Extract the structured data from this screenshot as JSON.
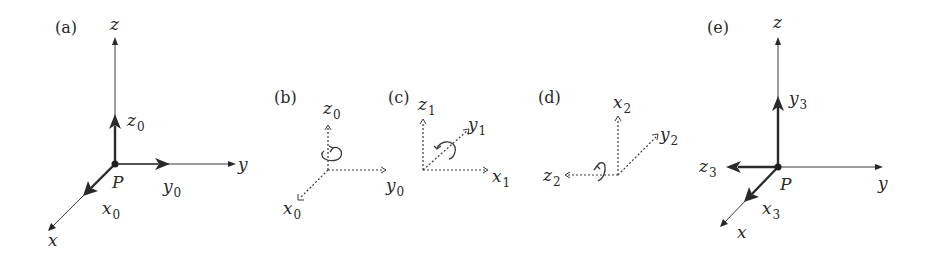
{
  "figure": {
    "panels": [
      {
        "id": "a",
        "label": "(a)",
        "origin_label": "P",
        "axes": {
          "z": "z",
          "y": "y",
          "x": "x"
        },
        "frame": {
          "z": {
            "base": "z",
            "sub": "0"
          },
          "y": {
            "base": "y",
            "sub": "0"
          },
          "x": {
            "base": "x",
            "sub": "0"
          }
        }
      },
      {
        "id": "b",
        "label": "(b)",
        "frame": {
          "z": {
            "base": "z",
            "sub": "0"
          },
          "y": {
            "base": "y",
            "sub": "0"
          },
          "x": {
            "base": "x",
            "sub": "0"
          }
        },
        "rotation_about": "z0"
      },
      {
        "id": "c",
        "label": "(c)",
        "frame": {
          "z": {
            "base": "z",
            "sub": "1"
          },
          "y": {
            "base": "y",
            "sub": "1"
          },
          "x": {
            "base": "x",
            "sub": "1"
          }
        },
        "rotation_about": "y1"
      },
      {
        "id": "d",
        "label": "(d)",
        "frame": {
          "x": {
            "base": "x",
            "sub": "2"
          },
          "y": {
            "base": "y",
            "sub": "2"
          },
          "z": {
            "base": "z",
            "sub": "2"
          }
        },
        "rotation_about": "z2"
      },
      {
        "id": "e",
        "label": "(e)",
        "origin_label": "P",
        "axes": {
          "z": "z",
          "y": "y",
          "x": "x"
        },
        "frame": {
          "y": {
            "base": "y",
            "sub": "3"
          },
          "z": {
            "base": "z",
            "sub": "3"
          },
          "x": {
            "base": "x",
            "sub": "3"
          }
        }
      }
    ]
  }
}
